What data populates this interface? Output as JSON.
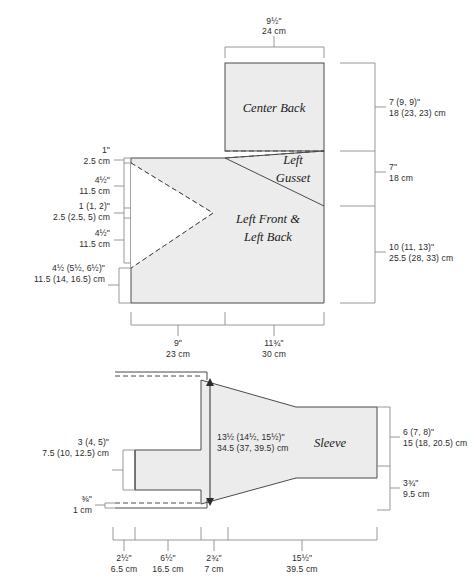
{
  "document": {
    "type": "garment-schematic",
    "title": "Sweater schematic with Center Back, Left Gusset, Left Front & Left Back, and Sleeve"
  },
  "colors": {
    "panel_fill": "#ececec",
    "line": "#4a4a4a",
    "lead": "#8c8c8c",
    "text": "#2b2b2b",
    "background": "#ffffff"
  },
  "body_diagram": {
    "pieces": [
      {
        "name": "center-back",
        "label": "Center Back"
      },
      {
        "name": "left-gusset",
        "label_line_1": "Left",
        "label_line_2": "Gusset"
      },
      {
        "name": "left-front-left-back",
        "label_line_1": "Left Front &",
        "label_line_2": "Left Back"
      }
    ],
    "top_dimension": {
      "imperial": "9½\"",
      "metric": "24 cm"
    },
    "right_dimensions": [
      {
        "name": "center-back-height",
        "imperial": "7 (9, 9)\"",
        "metric": "18 (23, 23) cm"
      },
      {
        "name": "gusset-height",
        "imperial": "7\"",
        "metric": "18 cm"
      },
      {
        "name": "front-back-height",
        "imperial": "10 (11, 13)\"",
        "metric": "25.5 (28, 33) cm"
      }
    ],
    "left_dimensions": [
      {
        "name": "shoulder-edge",
        "imperial": "1\"",
        "metric": "2.5 cm"
      },
      {
        "name": "upper-segment",
        "imperial": "4½\"",
        "metric": "11.5 cm"
      },
      {
        "name": "armhole-notch",
        "imperial": "1 (1, 2)\"",
        "metric": "2.5 (2.5, 5) cm"
      },
      {
        "name": "lower-segment",
        "imperial": "4½\"",
        "metric": "11.5 cm"
      },
      {
        "name": "side-length",
        "imperial": "4½ (5½, 6½)\"",
        "metric": "11.5 (14, 16.5) cm"
      }
    ],
    "bottom_dimensions": [
      {
        "name": "front-width",
        "imperial": "9\"",
        "metric": "23 cm"
      },
      {
        "name": "back-width",
        "imperial": "11¾\"",
        "metric": "30 cm"
      }
    ]
  },
  "sleeve_diagram": {
    "label": "Sleeve",
    "center_dimension": {
      "imperial": "13½ (14½, 15½)\"",
      "metric": "34.5 (37, 39.5) cm"
    },
    "left_dimensions": [
      {
        "name": "cuff-width",
        "imperial": "3 (4, 5)\"",
        "metric": "7.5 (10, 12.5) cm"
      },
      {
        "name": "hem-edge",
        "imperial": "⅜\"",
        "metric": "1 cm"
      }
    ],
    "right_dimensions": [
      {
        "name": "upper-arm-depth",
        "imperial": "6 (7, 8)\"",
        "metric": "15 (18, 20.5) cm"
      },
      {
        "name": "lower-arm-depth",
        "imperial": "3¾\"",
        "metric": "9.5 cm"
      }
    ],
    "bottom_dimensions": [
      {
        "name": "cuff-length",
        "imperial": "2½\"",
        "metric": "6.5 cm"
      },
      {
        "name": "taper-length",
        "imperial": "6½\"",
        "metric": "16.5 cm"
      },
      {
        "name": "underarm-length",
        "imperial": "2¾\"",
        "metric": "7 cm"
      },
      {
        "name": "sleeve-body-length",
        "imperial": "15½\"",
        "metric": "39.5 cm"
      }
    ]
  }
}
